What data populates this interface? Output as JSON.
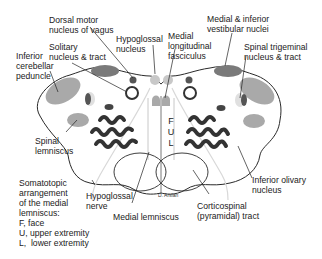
{
  "diagram": {
    "colors": {
      "outline": "#2a2a2a",
      "light_gray": "#c8c8c8",
      "mid_gray": "#a9a9a9",
      "dark_gray": "#7a7a7a",
      "black": "#333333",
      "fiber": "#d8d8d8"
    },
    "labels": {
      "dorsal_motor": "Dorsal motor\nnucleus of vagus",
      "hypoglossal_nucleus": "Hypoglossal\nnucleus",
      "mlf": "Medial\nlongitudinal\nfasciculus",
      "vestibular": "Medial & inferior\nvestibular nuclei",
      "solitary": "Solitary\nnucleus & tract",
      "icp": "Inferior\ncerebellar\npeduncle",
      "spinal_trigeminal": "Spinal trigeminal\nnucleus & tract",
      "spinal_lemniscus": "Spinal\nlemniscus",
      "somatotopic": "Somatotopic\narrangement\nof the medial\nlemniscus:\nF, face\nU, upper extremity\nL,  lower extremity",
      "hypoglossal_nerve": "Hypoglossal\nnerve",
      "medial_lemniscus": "Medial lemniscus",
      "corticospinal": "Corticospinal\n(pyramidal) tract",
      "inferior_olivary": "Inferior olivary\nnucleus",
      "credit": "D. Arslan",
      "f": "F",
      "u": "U",
      "l": "L"
    }
  }
}
